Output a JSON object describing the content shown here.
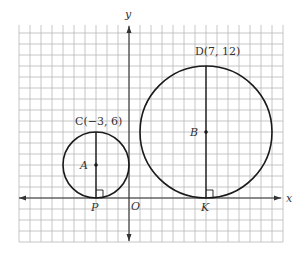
{
  "diagram": {
    "type": "coordinate-plane",
    "axes": {
      "x_label": "x",
      "y_label": "y",
      "origin_label": "O"
    },
    "grid": {
      "x_min": -10,
      "x_max": 14,
      "y_min": -4,
      "y_max": 16,
      "unit_px": 11
    },
    "circles": [
      {
        "name": "circle-A",
        "center_label": "A",
        "center": [
          -3,
          3
        ],
        "radius": 3,
        "top_point_label": "C(−3, 6)",
        "tangent_point_label": "P"
      },
      {
        "name": "circle-B",
        "center_label": "B",
        "center": [
          7,
          6
        ],
        "radius": 6,
        "top_point_label": "D(7, 12)",
        "tangent_point_label": "K"
      }
    ],
    "colors": {
      "grid": "#b8b8b8",
      "axis": "#333333",
      "curve": "#1a1a1a",
      "text": "#333333"
    }
  }
}
